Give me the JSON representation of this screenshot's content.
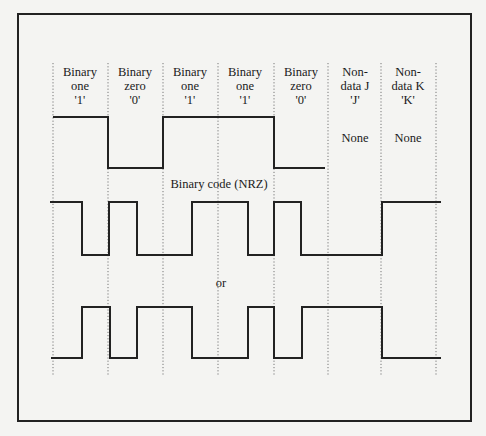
{
  "diagram": {
    "type": "line-coding-waveforms",
    "colors": {
      "line": "#222222",
      "grid": "#777777",
      "background": "#f4f4f2"
    },
    "columns": [
      {
        "line1": "Binary",
        "line2": "one",
        "line3": "'1'"
      },
      {
        "line1": "Binary",
        "line2": "zero",
        "line3": "'0'"
      },
      {
        "line1": "Binary",
        "line2": "one",
        "line3": "'1'"
      },
      {
        "line1": "Binary",
        "line2": "one",
        "line3": "'1'"
      },
      {
        "line1": "Binary",
        "line2": "zero",
        "line3": "'0'"
      },
      {
        "line1": "Non-",
        "line2": "data J",
        "line3": "'J'"
      },
      {
        "line1": "Non-",
        "line2": "data K",
        "line3": "'K'"
      }
    ],
    "nrz_none_labels": [
      "None",
      "None"
    ],
    "nrz_caption": "Binary code (NRZ)",
    "or_label": "or",
    "grid_x": [
      53,
      108,
      163,
      218,
      274,
      328,
      381,
      436
    ],
    "waveforms": {
      "nrz": {
        "bits": [
          "1",
          "0",
          "1",
          "1",
          "0"
        ],
        "points": "53,117 108,117 108,168 163,168 163,117 274,117 274,168 325,168"
      },
      "manchester_a": {
        "points": "50,202 82,202 82,255 109,255 109,202 137,202 137,255 192,255 192,202 248,202 248,255 274,255 274,202 301,202 301,255 382,255 382,202 441,202"
      },
      "manchester_b": {
        "points": "51,358 82,358 82,307 110,307 110,358 137,358 137,307 192,307 192,358 248,358 248,307 274,307 274,358 302,358 302,307 382,307 382,358 441,358"
      }
    }
  }
}
